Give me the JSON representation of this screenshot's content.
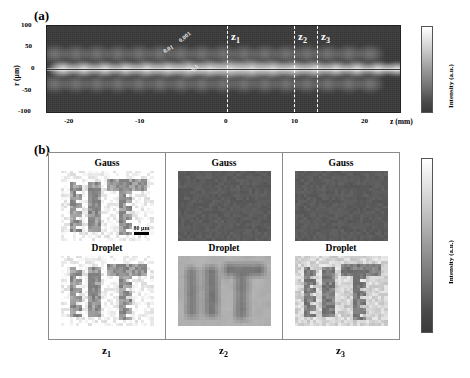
{
  "figure": {
    "panel_a_label": "(a)",
    "panel_b_label": "(b)"
  },
  "panel_a": {
    "xlabel": "z (mm)",
    "ylabel": "r (µm)",
    "xticks": [
      "-20",
      "-10",
      "0",
      "10",
      "20"
    ],
    "yticks": [
      "100",
      "50",
      "0",
      "-50",
      "-100"
    ],
    "colorbar_label": "Intensity (a.u.)",
    "contour_labels": [
      "0.001",
      "0.01",
      "0.1"
    ],
    "z_markers": [
      {
        "label": "z",
        "sub": "1"
      },
      {
        "label": "z",
        "sub": "2"
      },
      {
        "label": "z",
        "sub": "3"
      }
    ]
  },
  "panel_b": {
    "colorbar_label": "Intensity (a.u.)",
    "scalebar": "80 µm",
    "columns": [
      {
        "bottom_label": "z",
        "bottom_sub": "1",
        "rows": [
          {
            "caption": "Gauss",
            "style": "bright-sharp"
          },
          {
            "caption": "Droplet",
            "style": "bright-sharp"
          }
        ]
      },
      {
        "bottom_label": "z",
        "bottom_sub": "2",
        "rows": [
          {
            "caption": "Gauss",
            "style": "dark-blank"
          },
          {
            "caption": "Droplet",
            "style": "mid-blurry"
          }
        ]
      },
      {
        "bottom_label": "z",
        "bottom_sub": "3",
        "rows": [
          {
            "caption": "Gauss",
            "style": "dark-blank"
          },
          {
            "caption": "Droplet",
            "style": "mid-sharp"
          }
        ]
      }
    ]
  },
  "chart_data": {
    "type": "heatmap",
    "title": "",
    "panels": [
      {
        "id": "a",
        "label": "(a)",
        "type": "heatmap",
        "xlabel": "z (mm)",
        "ylabel": "r (µm)",
        "xlim": [
          -25,
          25
        ],
        "ylim": [
          -100,
          100
        ],
        "xticks": [
          -20,
          -10,
          0,
          10,
          20
        ],
        "yticks": [
          -100,
          -50,
          0,
          50,
          100
        ],
        "colorbar_label": "Intensity (a.u.)",
        "colormap": "gray",
        "grid": false,
        "description": "Longitudinal intensity map of a self-reconstructing beam showing a periodic on-axis filament with regularly spaced intensity lobes",
        "contour_levels": [
          0.001,
          0.01,
          0.1
        ],
        "lobe_period_mm": 3.0,
        "lobe_z_centers_mm": [
          -23.0,
          -20.0,
          -17.0,
          -14.2,
          -11.2,
          -8.2,
          -5.4,
          -2.4,
          0.4,
          3.4,
          6.3,
          9.2,
          12.1,
          15.0,
          18.0,
          21.0,
          23.8
        ],
        "annotations": [
          {
            "text": "z1",
            "z_mm": 0.0,
            "type": "dashed-vline"
          },
          {
            "text": "z2",
            "z_mm": 8.8,
            "type": "dashed-vline"
          },
          {
            "text": "z3",
            "z_mm": 11.9,
            "type": "dashed-vline"
          },
          {
            "text": "0.001",
            "type": "contour-label"
          },
          {
            "text": "0.01",
            "type": "contour-label"
          },
          {
            "text": "0.1",
            "type": "contour-label"
          }
        ]
      },
      {
        "id": "b",
        "label": "(b)",
        "type": "image-grid",
        "rows": [
          "Gauss",
          "Droplet"
        ],
        "columns": [
          "z1",
          "z2",
          "z3"
        ],
        "colorbar_label": "Intensity (a.u.)",
        "colormap": "gray",
        "scalebar": "80 µm",
        "cells": [
          {
            "row": "Gauss",
            "column": "z1",
            "content": "IIT pattern",
            "visibility": "high",
            "background": "bright"
          },
          {
            "row": "Gauss",
            "column": "z2",
            "content": "none",
            "visibility": "none",
            "background": "dark"
          },
          {
            "row": "Gauss",
            "column": "z3",
            "content": "none",
            "visibility": "none",
            "background": "dark"
          },
          {
            "row": "Droplet",
            "column": "z1",
            "content": "IIT pattern",
            "visibility": "high",
            "background": "bright"
          },
          {
            "row": "Droplet",
            "column": "z2",
            "content": "IIT pattern",
            "visibility": "medium",
            "background": "mid-gray"
          },
          {
            "row": "Droplet",
            "column": "z3",
            "content": "IIT pattern",
            "visibility": "high",
            "background": "light-gray"
          }
        ]
      }
    ]
  }
}
